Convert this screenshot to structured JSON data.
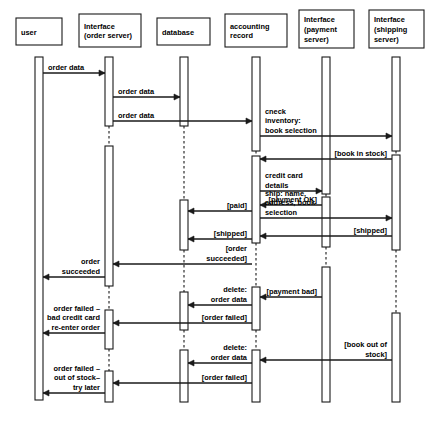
{
  "diagram": {
    "kind": "uml-sequence-diagram",
    "stroke_color": "#1a1a1a",
    "background_color": "#ffffff",
    "width": 437,
    "height": 425,
    "participants": [
      {
        "id": "user",
        "label_lines": [
          "user"
        ],
        "x": 39,
        "box": {
          "x": 16,
          "y": 18,
          "w": 46,
          "h": 27
        }
      },
      {
        "id": "ordersrv",
        "label_lines": [
          "Interface",
          "(order server)"
        ],
        "x": 109,
        "box": {
          "x": 79,
          "y": 14,
          "w": 62,
          "h": 33
        }
      },
      {
        "id": "database",
        "label_lines": [
          "database"
        ],
        "x": 184,
        "box": {
          "x": 157,
          "y": 18,
          "w": 53,
          "h": 27
        }
      },
      {
        "id": "accounting",
        "label_lines": [
          "accounting",
          "record"
        ],
        "x": 256,
        "box": {
          "x": 225,
          "y": 14,
          "w": 62,
          "h": 33
        }
      },
      {
        "id": "paymentsrv",
        "label_lines": [
          "Interface",
          "(payment",
          "server)"
        ],
        "x": 326,
        "box": {
          "x": 299,
          "y": 10,
          "w": 55,
          "h": 38
        }
      },
      {
        "id": "shipsrv",
        "label_lines": [
          "Interface",
          "(shipping",
          "server)"
        ],
        "x": 396,
        "box": {
          "x": 369,
          "y": 10,
          "w": 55,
          "h": 38
        }
      }
    ],
    "messages": [
      {
        "id": "m1",
        "label_lines": [
          "order data"
        ],
        "from": "user",
        "to": "ordersrv",
        "y": 73,
        "dir": "right"
      },
      {
        "id": "m2",
        "label_lines": [
          "order data"
        ],
        "from": "ordersrv",
        "to": "database",
        "y": 97,
        "dir": "right"
      },
      {
        "id": "m3",
        "label_lines": [
          "order data"
        ],
        "from": "ordersrv",
        "to": "accounting",
        "y": 121,
        "dir": "right"
      },
      {
        "id": "m4",
        "label_lines": [
          "cneck",
          "inventory:",
          "book selection"
        ],
        "from": "accounting",
        "to": "shipsrv",
        "y": 136,
        "dir": "right"
      },
      {
        "id": "m5",
        "label_lines": [
          "[book in stock]"
        ],
        "from": "shipsrv",
        "to": "accounting",
        "y": 159,
        "dir": "left"
      },
      {
        "id": "m6",
        "label_lines": [
          "credit card",
          "details"
        ],
        "from": "accounting",
        "to": "paymentsrv",
        "y": 191,
        "dir": "right"
      },
      {
        "id": "m7",
        "label_lines": [
          "[payment  OK]"
        ],
        "from": "paymentsrv",
        "to": "accounting",
        "y": 205,
        "dir": "left"
      },
      {
        "id": "m8",
        "label_lines": [
          "ship: name,",
          "address, book",
          "selection"
        ],
        "from": "accounting",
        "to": "shipsrv",
        "y": 218,
        "dir": "right"
      },
      {
        "id": "m9",
        "label_lines": [
          "[shipped]"
        ],
        "from": "shipsrv",
        "to": "accounting",
        "y": 236,
        "dir": "left"
      },
      {
        "id": "m10",
        "label_lines": [
          "[paid]"
        ],
        "from": "accounting",
        "to": "database",
        "y": 211,
        "dir": "left"
      },
      {
        "id": "m11",
        "label_lines": [
          "[shipped]"
        ],
        "from": "accounting",
        "to": "database",
        "y": 239,
        "dir": "left"
      },
      {
        "id": "m12",
        "label_lines": [
          "[order",
          "succeeded]"
        ],
        "from": "accounting",
        "to": "ordersrv",
        "y": 264,
        "dir": "left"
      },
      {
        "id": "m13",
        "label_lines": [
          "order",
          "succeeded"
        ],
        "from": "ordersrv",
        "to": "user",
        "y": 277,
        "dir": "left"
      },
      {
        "id": "m14",
        "label_lines": [
          "[payment  bad]"
        ],
        "from": "paymentsrv",
        "to": "accounting",
        "y": 297,
        "dir": "left"
      },
      {
        "id": "m15",
        "label_lines": [
          "delete:",
          "order data"
        ],
        "from": "accounting",
        "to": "database",
        "y": 305,
        "dir": "left"
      },
      {
        "id": "m16",
        "label_lines": [
          "[order failed]"
        ],
        "from": "accounting",
        "to": "ordersrv",
        "y": 323,
        "dir": "left"
      },
      {
        "id": "m17",
        "label_lines": [
          "order failed –",
          "bad credit card",
          "re-enter order"
        ],
        "from": "ordersrv",
        "to": "user",
        "y": 333,
        "dir": "left"
      },
      {
        "id": "m18",
        "label_lines": [
          "[book out of",
          "stock]"
        ],
        "from": "shipsrv",
        "to": "accounting",
        "y": 360,
        "dir": "left"
      },
      {
        "id": "m19",
        "label_lines": [
          "delete:",
          "order data"
        ],
        "from": "accounting",
        "to": "database",
        "y": 363,
        "dir": "left"
      },
      {
        "id": "m20",
        "label_lines": [
          "[order failed]"
        ],
        "from": "accounting",
        "to": "ordersrv",
        "y": 383,
        "dir": "left"
      },
      {
        "id": "m21",
        "label_lines": [
          "order failed –",
          "out of stock–",
          "try later"
        ],
        "from": "ordersrv",
        "to": "user",
        "y": 393,
        "dir": "left"
      }
    ],
    "activations": [
      {
        "id": "a-user-1",
        "participant": "user",
        "y": 57,
        "h": 343
      },
      {
        "id": "a-order-1",
        "participant": "ordersrv",
        "y": 57,
        "h": 69
      },
      {
        "id": "a-order-2",
        "participant": "ordersrv",
        "y": 146,
        "h": 140
      },
      {
        "id": "a-order-3",
        "participant": "ordersrv",
        "y": 310,
        "h": 39
      },
      {
        "id": "a-order-4",
        "participant": "ordersrv",
        "y": 371,
        "h": 31
      },
      {
        "id": "a-db-1",
        "participant": "database",
        "y": 57,
        "h": 69
      },
      {
        "id": "a-db-2",
        "participant": "database",
        "y": 200,
        "h": 50
      },
      {
        "id": "a-db-3",
        "participant": "database",
        "y": 292,
        "h": 38
      },
      {
        "id": "a-db-4",
        "participant": "database",
        "y": 350,
        "h": 52
      },
      {
        "id": "a-acc-1",
        "participant": "accounting",
        "y": 57,
        "h": 94
      },
      {
        "id": "a-acc-2",
        "participant": "accounting",
        "y": 156,
        "h": 87
      },
      {
        "id": "a-acc-3",
        "participant": "accounting",
        "y": 287,
        "h": 43
      },
      {
        "id": "a-acc-4",
        "participant": "accounting",
        "y": 350,
        "h": 52
      },
      {
        "id": "a-pay-1",
        "participant": "paymentsrv",
        "y": 57,
        "h": 137
      },
      {
        "id": "a-pay-2",
        "participant": "paymentsrv",
        "y": 197,
        "h": 50
      },
      {
        "id": "a-pay-3",
        "participant": "paymentsrv",
        "y": 267,
        "h": 135
      },
      {
        "id": "a-ship-1",
        "participant": "shipsrv",
        "y": 57,
        "h": 94
      },
      {
        "id": "a-ship-2",
        "participant": "shipsrv",
        "y": 155,
        "h": 95
      },
      {
        "id": "a-ship-3",
        "participant": "shipsrv",
        "y": 313,
        "h": 89
      }
    ],
    "lifeline_dashes": [
      {
        "id": "d-order-1",
        "participant": "ordersrv",
        "y1": 126,
        "y2": 146
      },
      {
        "id": "d-order-2",
        "participant": "ordersrv",
        "y1": 286,
        "y2": 310
      },
      {
        "id": "d-order-3",
        "participant": "ordersrv",
        "y1": 349,
        "y2": 371
      },
      {
        "id": "d-db-1",
        "participant": "database",
        "y1": 126,
        "y2": 200
      },
      {
        "id": "d-db-2",
        "participant": "database",
        "y1": 250,
        "y2": 292
      },
      {
        "id": "d-db-3",
        "participant": "database",
        "y1": 330,
        "y2": 350
      },
      {
        "id": "d-acc-1",
        "participant": "accounting",
        "y1": 151,
        "y2": 156
      },
      {
        "id": "d-acc-2",
        "participant": "accounting",
        "y1": 243,
        "y2": 287
      },
      {
        "id": "d-acc-3",
        "participant": "accounting",
        "y1": 330,
        "y2": 350
      },
      {
        "id": "d-pay-1",
        "participant": "paymentsrv",
        "y1": 194,
        "y2": 197
      },
      {
        "id": "d-pay-2",
        "participant": "paymentsrv",
        "y1": 247,
        "y2": 267
      },
      {
        "id": "d-ship-1",
        "participant": "shipsrv",
        "y1": 151,
        "y2": 155
      },
      {
        "id": "d-ship-2",
        "participant": "shipsrv",
        "y1": 250,
        "y2": 313
      }
    ]
  }
}
